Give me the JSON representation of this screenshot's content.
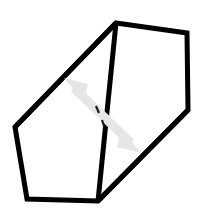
{
  "figure": {
    "background_color": "#ffffff",
    "canvas": {
      "width": 201,
      "height": 215
    },
    "stroke_color": "#000000",
    "stroke_width": 5,
    "arrow_color": "#e6e6e6",
    "arrow_width": 9,
    "shapes": {
      "outline": {
        "name": "hexagon-outline",
        "kind": "closed-polygon",
        "points": "116,23 187,33 188,110 98,201 27,199 15,127"
      },
      "interior_edge": {
        "name": "interior-diagonal-edge",
        "kind": "line",
        "x1": 116,
        "y1": 23,
        "x2": 98,
        "y2": 201
      },
      "upper_left_edge": {
        "name": "upper-left-face-edge",
        "kind": "line",
        "x1": 116,
        "y1": 23,
        "x2": 15,
        "y2": 127
      },
      "lower_right_edge": {
        "name": "lower-right-face-edge",
        "kind": "line",
        "x1": 188,
        "y1": 110,
        "x2": 98,
        "y2": 201
      }
    },
    "arrow": {
      "name": "double-headed-arrow",
      "kind": "double-arrow",
      "shaft": {
        "x1": 74,
        "y1": 88,
        "x2": 131,
        "y2": 143
      },
      "head_upper": {
        "tip_x": 66,
        "tip_y": 80,
        "points": "66,80 85,83 83,99"
      },
      "head_lower": {
        "tip_x": 139,
        "tip_y": 151,
        "points": "139,151 120,148 122,132"
      },
      "center_tick": {
        "x1": 96,
        "y1": 106,
        "x2": 104,
        "y2": 124
      }
    }
  }
}
